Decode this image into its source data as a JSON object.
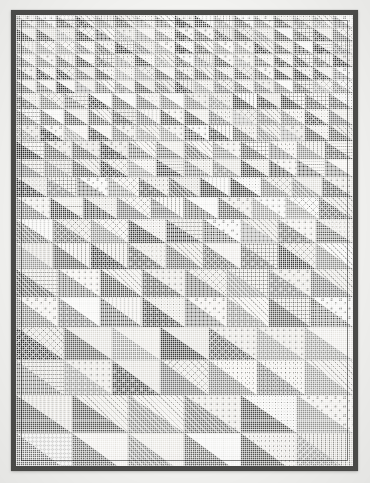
{
  "artwork": {
    "title": "Scrappy Half-Square Triangle Quilt",
    "medium": "Pieced cotton patchwork quilt, black and white photograph",
    "palette": {
      "background": "#f3f3f1",
      "binding": "#4a4a48",
      "field": "#e9e9e6",
      "lightest": "#f4f4f2",
      "darkest": "#262625"
    },
    "block": {
      "name": "half-square-triangle",
      "orientation": "dark triangle lower-left, light triangle upper-right",
      "count_total": 352
    },
    "layout": {
      "note": "Rows increase in scale from top to bottom creating a perspective gradient",
      "row_heights": [
        13,
        13,
        13,
        13,
        13,
        13,
        16,
        16,
        16,
        18,
        18,
        20,
        22,
        24,
        26,
        28,
        30,
        33,
        35,
        38,
        41
      ],
      "columns_per_row": [
        17,
        17,
        17,
        17,
        17,
        17,
        14,
        14,
        14,
        12,
        12,
        11,
        10,
        9,
        9,
        8,
        8,
        7,
        7,
        6,
        6
      ]
    },
    "tones": {
      "light_values": [
        "#f4f4f2",
        "#eceae6",
        "#e4e2dd",
        "#f0eeea",
        "#e8e6e1",
        "#f2f0ec",
        "#dedcd7",
        "#e6e4df"
      ],
      "dark_values": [
        "#3a3a38",
        "#5b5b58",
        "#717170",
        "#4a4a47",
        "#8a8a87",
        "#2d2d2c",
        "#646461",
        "#7d7d7a",
        "#969693",
        "#535350"
      ]
    },
    "prints": [
      "solid",
      "dot-small",
      "dot-large",
      "stripe-diagonal",
      "stripe-vertical",
      "check",
      "crosshatch",
      "floral",
      "speckle",
      "grid"
    ]
  }
}
